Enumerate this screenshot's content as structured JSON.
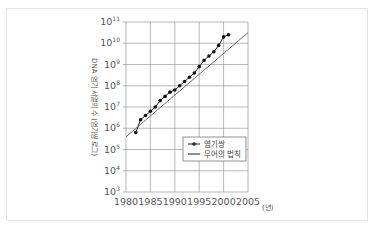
{
  "chart_data": {
    "type": "line",
    "title": "",
    "xlabel": "(년)",
    "ylabel": "DNA 염기 서열의 수 (염기쌍 로그)",
    "x_ticks": [
      "1980",
      "1985",
      "1990",
      "1995",
      "2000",
      "2005"
    ],
    "y_ticks": [
      "10^3",
      "10^4",
      "10^5",
      "10^6",
      "10^7",
      "10^8",
      "10^9",
      "10^10",
      "10^11"
    ],
    "y_scale": "log",
    "xlim": [
      1980,
      2005
    ],
    "ylim_log10": [
      3,
      11
    ],
    "grid": true,
    "legend_position": "lower-right inside plot",
    "series": [
      {
        "name": "염기쌍",
        "style": "line-with-markers",
        "x": [
          1982,
          1983,
          1984,
          1985,
          1986,
          1987,
          1988,
          1989,
          1990,
          1991,
          1992,
          1993,
          1994,
          1995,
          1996,
          1997,
          1998,
          1999,
          2000,
          2001
        ],
        "log10_y": [
          5.8,
          6.4,
          6.6,
          6.8,
          7.0,
          7.3,
          7.5,
          7.7,
          7.8,
          8.0,
          8.2,
          8.4,
          8.6,
          8.9,
          9.2,
          9.4,
          9.6,
          9.9,
          10.3,
          10.4
        ]
      },
      {
        "name": "무어의 법칙",
        "style": "line",
        "x": [
          1980,
          2005
        ],
        "log10_y": [
          5.6,
          10.5
        ]
      }
    ]
  },
  "legend": {
    "items": [
      {
        "label": "염기쌍"
      },
      {
        "label": "무어의 법칙"
      }
    ]
  },
  "axis": {
    "x_unit": "(년)",
    "y_label": "DNA 염기 서열의 수 (염기쌍 로그)",
    "x_ticks": [
      "1980",
      "1985",
      "1990",
      "1995",
      "2000",
      "2005"
    ],
    "y_exponents": [
      "3",
      "4",
      "5",
      "6",
      "7",
      "8",
      "9",
      "10",
      "11"
    ]
  }
}
